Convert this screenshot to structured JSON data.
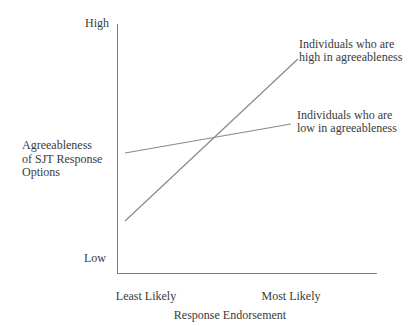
{
  "figure": {
    "background": "#ffffff",
    "text_color": "#3a3a3a",
    "axis_color": "#7d7d7d",
    "series_line_color": "#8a8a8a"
  },
  "chart_data": {
    "type": "line",
    "title": "",
    "xlabel": "Response Endorsement",
    "ylabel": "Agreeableness\nof SJT Response\nOptions",
    "x_tick_labels": [
      "Least Likely",
      "Most Likely"
    ],
    "y_tick_labels": [
      "Low",
      "High"
    ],
    "x_range": [
      0,
      1
    ],
    "y_range": [
      0,
      1
    ],
    "grid": false,
    "legend_position": "inline-annotations",
    "series": [
      {
        "name": "Individuals who are high in agreeableness",
        "x": [
          0.027,
          0.692
        ],
        "y": [
          0.212,
          0.86
        ]
      },
      {
        "name": "Individuals who are low in agreeableness",
        "x": [
          0.027,
          0.665
        ],
        "y": [
          0.484,
          0.6
        ]
      }
    ],
    "annotations": [
      {
        "text": "Individuals who are\nhigh in agreeableness",
        "series": "high"
      },
      {
        "text": "Individuals who are\nlow in agreeableness",
        "series": "low"
      }
    ]
  }
}
